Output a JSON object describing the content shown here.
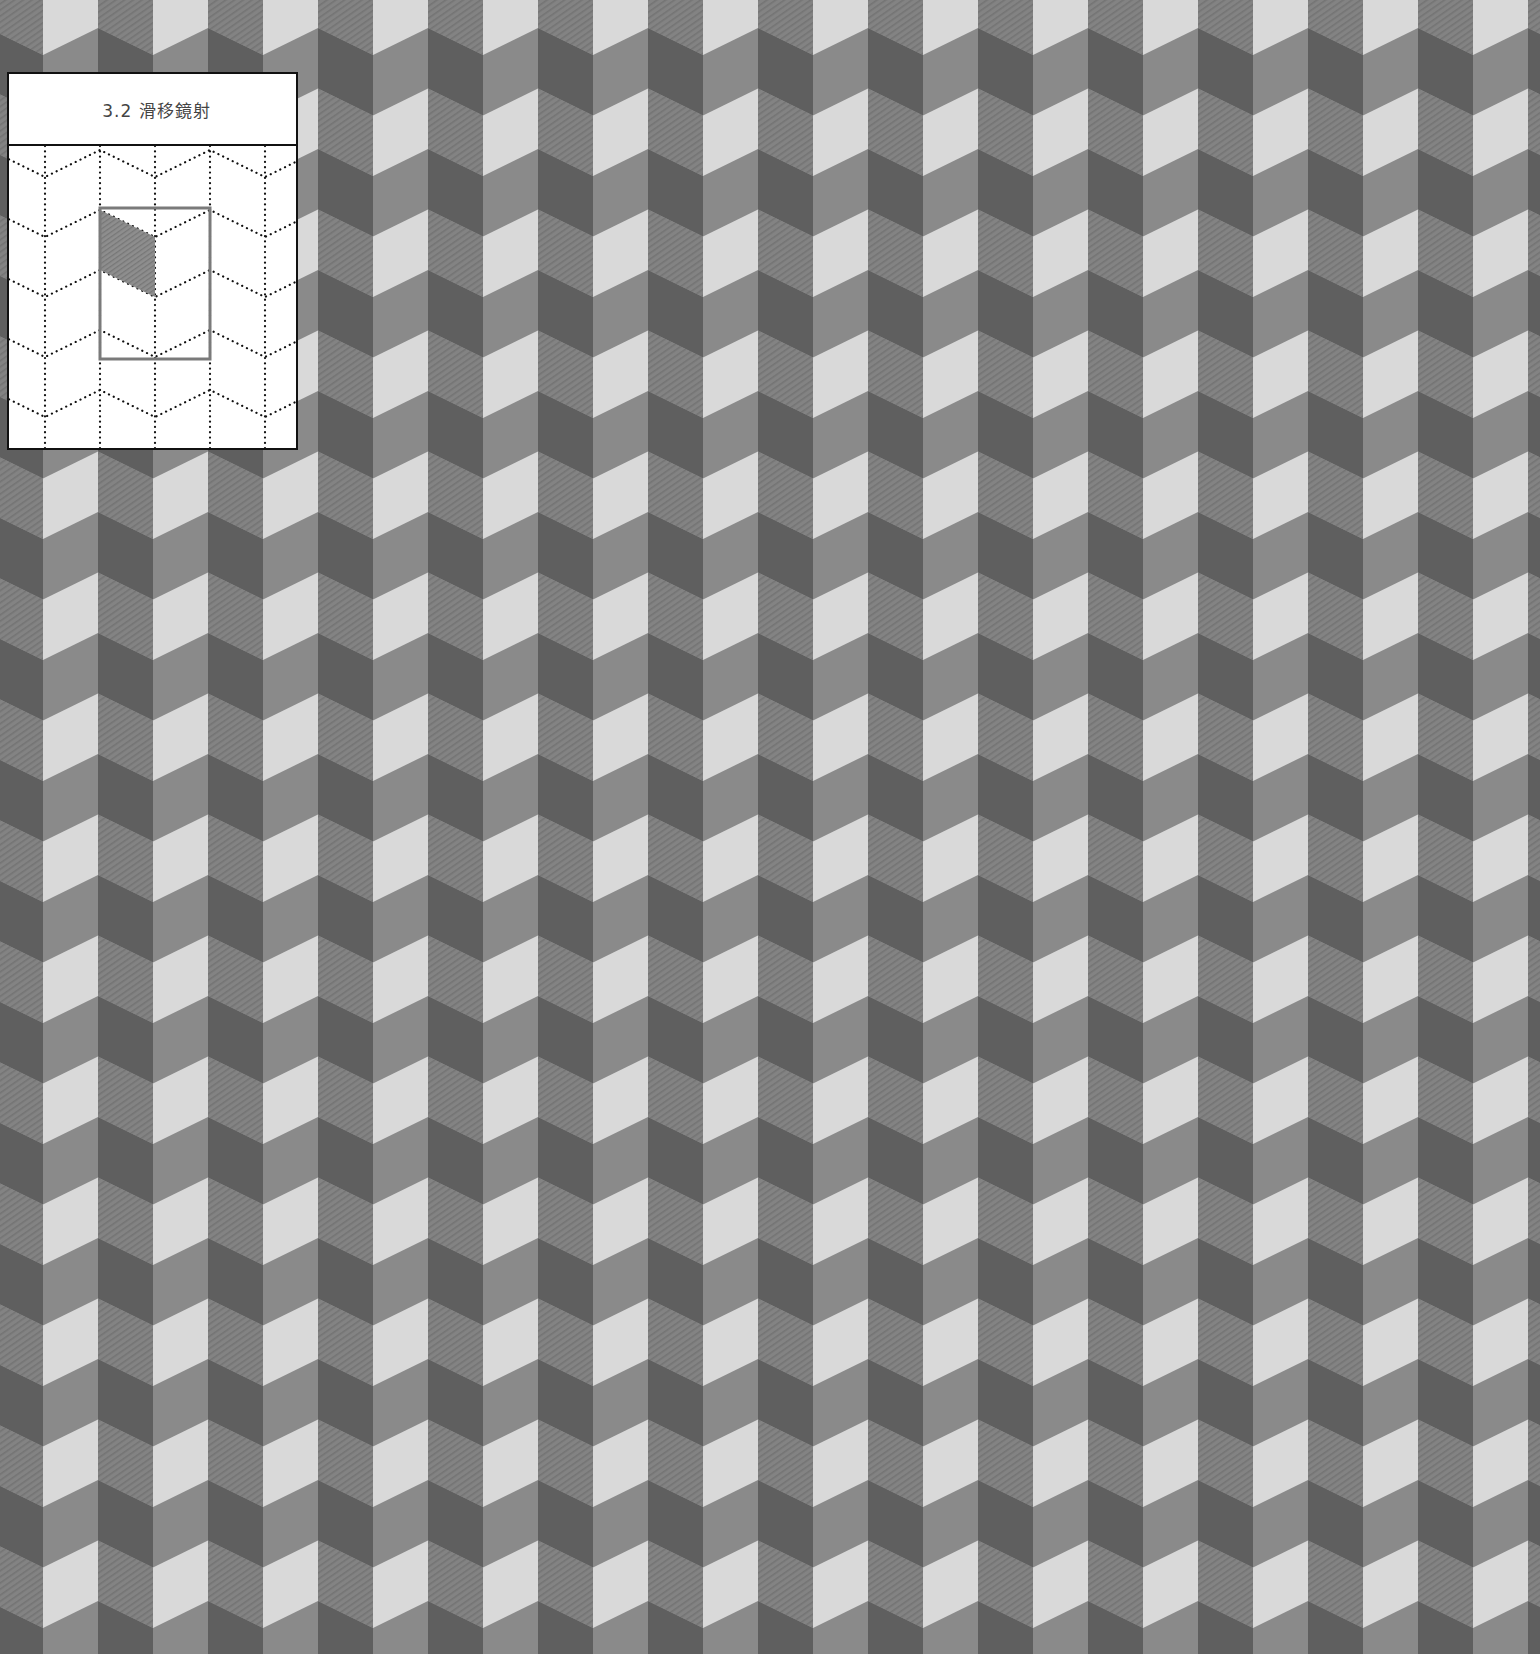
{
  "figure": {
    "title": "3.2 滑移鏡射",
    "caption_section": "3.2",
    "caption_text": "滑移鏡射"
  },
  "pattern": {
    "type": "chevron-tessellation",
    "symmetry": "glide-reflection",
    "column_width_px": 55,
    "vertical_period_px": 121,
    "slant_px": 27,
    "colors": {
      "light": "#d9d9d9",
      "mid": "#8a8a8a",
      "dark": "#5f5f5f",
      "hatched": "#838383",
      "hatch_stripe": "#747474",
      "frame": "#111111",
      "highlight": "#7a7a7a"
    }
  },
  "inset": {
    "dotted_grid_columns_x": [
      43,
      98,
      153,
      208,
      263
    ],
    "fundamental_region": "rectangle",
    "shaded_tile": "parallelogram"
  }
}
